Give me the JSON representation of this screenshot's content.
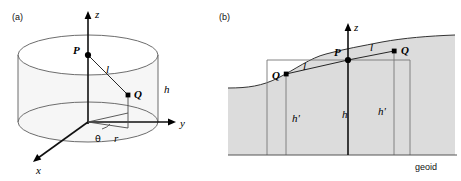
{
  "figure": {
    "type": "diagram",
    "background_color": "#ffffff",
    "width": 461,
    "height": 181
  },
  "panel_a": {
    "tag": "(a)",
    "axes": [
      {
        "name": "z-axis",
        "label": "z",
        "direction": "up"
      },
      {
        "name": "y-axis",
        "label": "y",
        "direction": "right"
      },
      {
        "name": "x-axis",
        "label": "x",
        "direction": "down-left"
      }
    ],
    "points": [
      {
        "name": "P",
        "label": "P",
        "marker": "round",
        "position": "on z-axis, upper region"
      },
      {
        "name": "Q",
        "label": "Q",
        "marker": "square",
        "position": "interior of cylinder, right of axis"
      }
    ],
    "segments": [
      {
        "name": "distance-l",
        "label": "l",
        "from": "P",
        "to": "Q"
      }
    ],
    "dimensions": [
      {
        "name": "cylinder-height",
        "label": "h"
      },
      {
        "name": "radial-distance",
        "label": "r"
      },
      {
        "name": "azimuth-angle",
        "label": "θ"
      }
    ],
    "shape": {
      "name": "cylinder",
      "fill_color": "#eeeeee",
      "outline_color": "#6d6d6d"
    }
  },
  "panel_b": {
    "tag": "(b)",
    "axes": [
      {
        "name": "z-axis",
        "label": "z",
        "direction": "up"
      }
    ],
    "points": [
      {
        "name": "P",
        "label": "P",
        "marker": "round",
        "position": "on terrain surface at z-axis"
      },
      {
        "name": "Q-left",
        "label": "Q",
        "marker": "square",
        "position": "left of P, above terrain"
      },
      {
        "name": "Q-right",
        "label": "Q",
        "marker": "square",
        "position": "right of P, below terrain surface"
      }
    ],
    "segments": [
      {
        "name": "distance-l-left",
        "label": "l",
        "from": "Q-left",
        "to": "P"
      },
      {
        "name": "distance-l-right",
        "label": "l",
        "from": "P",
        "to": "Q-right"
      }
    ],
    "dimensions": [
      {
        "name": "height-h",
        "label": "h"
      },
      {
        "name": "height-h-prime-left",
        "label": "h'"
      },
      {
        "name": "height-h-prime-right",
        "label": "h'"
      }
    ],
    "reference_surface": {
      "name": "geoid",
      "label": "geoid"
    },
    "terrain": {
      "name": "topographic-surface",
      "fill_color": "#dcdcdc",
      "line_color": "#333333"
    }
  }
}
